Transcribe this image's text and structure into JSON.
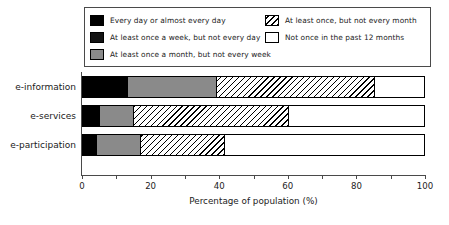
{
  "chart_data": {
    "type": "bar",
    "orientation": "horizontal",
    "stacked": true,
    "title": "",
    "xlabel": "Percentage of population (%)",
    "ylabel": "",
    "xlim": [
      0,
      100
    ],
    "xticks": [
      0,
      10,
      20,
      30,
      40,
      50,
      60,
      70,
      80,
      90,
      100
    ],
    "xtick_labels": [
      "0",
      "",
      "20",
      "",
      "40",
      "",
      "60",
      "",
      "80",
      "",
      "100"
    ],
    "grid": false,
    "legend_position": "top",
    "categories": [
      "e-information",
      "e-services",
      "e-participation"
    ],
    "series": [
      {
        "name": "Every day or almost every day",
        "color": "#000000",
        "pattern": "solid",
        "values": [
          13,
          5,
          4
        ]
      },
      {
        "name": "At least once a week, but not every day",
        "color": "#131313",
        "pattern": "solid",
        "values": [
          0,
          0,
          0
        ]
      },
      {
        "name": "At least once a month, but not every week",
        "color": "#8a8a8a",
        "pattern": "solid",
        "values": [
          26,
          10,
          13
        ]
      },
      {
        "name": "At least once, but not every month",
        "color": "#ffffff",
        "pattern": "diagonal-hatch",
        "values": [
          46,
          45,
          24.5
        ]
      },
      {
        "name": "Not once in the past 12 months",
        "color": "#ffffff",
        "pattern": "none",
        "values": [
          15,
          40,
          58.5
        ]
      }
    ]
  },
  "legend": {
    "items": [
      {
        "label": "Every day or almost every day",
        "swatch": "fill-s0",
        "column": "left"
      },
      {
        "label": "At least once a week, but not every day",
        "swatch": "fill-s1",
        "column": "left"
      },
      {
        "label": "At least once a month, but not every week",
        "swatch": "fill-s2",
        "column": "left"
      },
      {
        "label": "At least once, but not every month",
        "swatch": "fill-s3",
        "column": "right"
      },
      {
        "label": "Not once in the past 12 months",
        "swatch": "fill-s4",
        "column": "right"
      }
    ]
  },
  "axis": {
    "x_title": "Percentage of population (%)",
    "tick_0": "0",
    "tick_20": "20",
    "tick_40": "40",
    "tick_60": "60",
    "tick_80": "80",
    "tick_100": "100"
  },
  "categories": {
    "c0": "e-information",
    "c1": "e-services",
    "c2": "e-participation"
  }
}
